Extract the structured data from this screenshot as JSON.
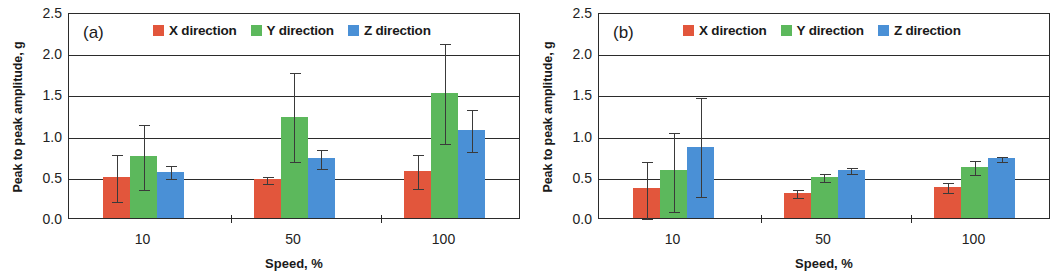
{
  "figure": {
    "panels": [
      "a",
      "b"
    ]
  },
  "chart_data": [
    {
      "type": "bar",
      "panel_tag": "(a)",
      "title": "",
      "xlabel": "Speed, %",
      "ylabel": "Peak to peak amplitude, g",
      "categories": [
        "10",
        "50",
        "100"
      ],
      "ylim": [
        0.0,
        2.5
      ],
      "yticks": [
        "2.5",
        "2.0",
        "1.5",
        "1.0",
        "0.5",
        "0.0"
      ],
      "ytick_values": [
        2.5,
        2.0,
        1.5,
        1.0,
        0.5,
        0.0
      ],
      "grid": "horizontal",
      "legend_position": "top-right-inside",
      "series": [
        {
          "name": "X direction",
          "color": "#e2563c",
          "values": [
            0.5,
            0.47,
            0.57
          ],
          "err_low": [
            0.21,
            0.43,
            0.36
          ],
          "err_high": [
            0.79,
            0.52,
            0.79
          ]
        },
        {
          "name": "Y direction",
          "color": "#5cb85c",
          "values": [
            0.75,
            1.23,
            1.52
          ],
          "err_low": [
            0.35,
            0.69,
            0.91
          ],
          "err_high": [
            1.15,
            1.79,
            2.13
          ]
        },
        {
          "name": "Z direction",
          "color": "#4a90d6",
          "values": [
            0.56,
            0.73,
            1.07
          ],
          "err_low": [
            0.48,
            0.61,
            0.81
          ],
          "err_high": [
            0.65,
            0.85,
            1.33
          ]
        }
      ]
    },
    {
      "type": "bar",
      "panel_tag": "(b)",
      "title": "",
      "xlabel": "Speed, %",
      "ylabel": "Peak to peak amplitude, g",
      "categories": [
        "10",
        "50",
        "100"
      ],
      "ylim": [
        0.0,
        2.5
      ],
      "yticks": [
        "2.5",
        "2.0",
        "1.5",
        "1.0",
        "0.5",
        "0.0"
      ],
      "ytick_values": [
        2.5,
        2.0,
        1.5,
        1.0,
        0.5,
        0.0
      ],
      "grid": "horizontal",
      "legend_position": "top-right-inside",
      "series": [
        {
          "name": "X direction",
          "color": "#e2563c",
          "values": [
            0.36,
            0.3,
            0.38
          ],
          "err_low": [
            0.0,
            0.25,
            0.31
          ],
          "err_high": [
            0.7,
            0.36,
            0.45
          ]
        },
        {
          "name": "Y direction",
          "color": "#5cb85c",
          "values": [
            0.58,
            0.5,
            0.62
          ],
          "err_low": [
            0.08,
            0.45,
            0.53
          ],
          "err_high": [
            1.06,
            0.56,
            0.71
          ]
        },
        {
          "name": "Z direction",
          "color": "#4a90d6",
          "values": [
            0.86,
            0.58,
            0.73
          ],
          "err_low": [
            0.27,
            0.54,
            0.69
          ],
          "err_high": [
            1.48,
            0.63,
            0.77
          ]
        }
      ]
    }
  ]
}
